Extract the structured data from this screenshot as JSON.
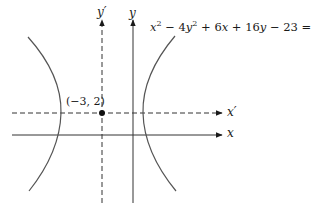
{
  "figure": {
    "equation": {
      "x2": "x",
      "sup1": "2",
      "minus1": " − 4",
      "y2": "y",
      "sup2": "2",
      "rest1": " + 6",
      "x3": "x",
      "rest2": " + 16",
      "y3": "y",
      "rest3": " − 23 = 0"
    },
    "axes": {
      "x_label": "x",
      "y_label": "y",
      "x_prime_label": "x′",
      "y_prime_label": "y′"
    },
    "center_point": {
      "label": "(−3, 2)"
    },
    "colors": {
      "ink": "#1a1a1a",
      "curve": "#555555"
    }
  }
}
